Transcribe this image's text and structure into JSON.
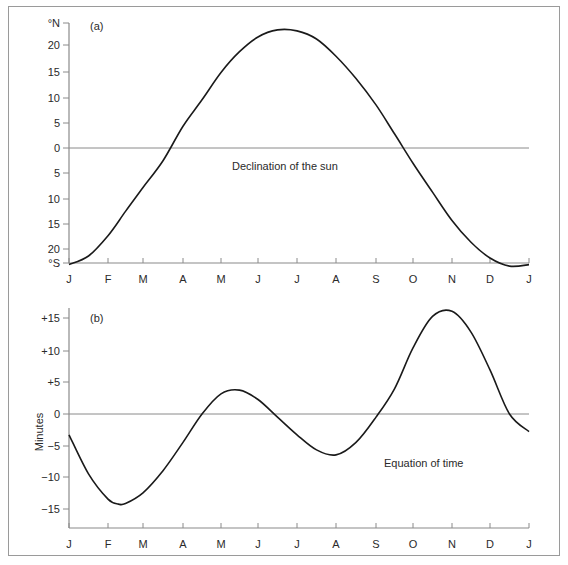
{
  "chart_data": [
    {
      "type": "line",
      "panel": "(a)",
      "title": "Declination of the sun",
      "xlabel": "",
      "ylabel": "",
      "x_tick_labels": [
        "J",
        "F",
        "M",
        "A",
        "M",
        "J",
        "J",
        "A",
        "S",
        "O",
        "N",
        "D",
        "J"
      ],
      "y_tick_labels": [
        "°N",
        "20",
        "15",
        "10",
        "5",
        "0",
        "5",
        "10",
        "15",
        "20",
        "°S"
      ],
      "y_units_top": "°N",
      "y_units_bottom": "°S",
      "ylim": [
        -23.5,
        23.5
      ],
      "grid": false,
      "zero_line": true,
      "series": [
        {
          "name": "Declination of the sun (degrees, N positive)",
          "x": [
            0,
            0.5,
            1,
            1.5,
            2,
            2.5,
            3,
            3.5,
            4,
            4.5,
            5,
            5.5,
            6,
            6.5,
            7,
            7.5,
            8,
            8.5,
            9,
            9.5,
            10,
            10.5,
            11,
            11.5,
            12
          ],
          "values": [
            -23.0,
            -21.3,
            -17.3,
            -12.5,
            -7.8,
            -2.5,
            4.3,
            9.5,
            14.9,
            19.0,
            21.9,
            23.3,
            23.1,
            21.5,
            18.1,
            13.7,
            8.5,
            2.8,
            -3.0,
            -8.7,
            -14.3,
            -18.6,
            -21.7,
            -23.3,
            -23.0
          ]
        }
      ]
    },
    {
      "type": "line",
      "panel": "(b)",
      "title": "Equation of time",
      "xlabel": "",
      "ylabel": "Minutes",
      "x_tick_labels": [
        "J",
        "F",
        "M",
        "A",
        "M",
        "J",
        "J",
        "A",
        "S",
        "O",
        "N",
        "D",
        "J"
      ],
      "y_tick_labels": [
        "+15",
        "+10",
        "+5",
        "0",
        "−5",
        "−10",
        "−15"
      ],
      "ylim": [
        -18,
        16.5
      ],
      "grid": false,
      "zero_line": true,
      "series": [
        {
          "name": "Equation of time (minutes)",
          "x": [
            0,
            0.5,
            1,
            1.3,
            1.5,
            2,
            2.5,
            3,
            3.5,
            4,
            4.5,
            5,
            5.5,
            6,
            6.5,
            7,
            7.5,
            8,
            8.5,
            9,
            9.5,
            10,
            10.5,
            11,
            11.5,
            12
          ],
          "values": [
            -3.3,
            -9.5,
            -13.5,
            -14.3,
            -14.2,
            -12.5,
            -9.0,
            -4.5,
            0,
            3.2,
            3.8,
            2.3,
            -0.5,
            -3.3,
            -5.7,
            -6.5,
            -4.5,
            -0.5,
            4.0,
            10.5,
            15.5,
            16.3,
            13.0,
            7.0,
            0,
            -2.8
          ]
        }
      ]
    }
  ],
  "panel_a": {
    "label": "(a)",
    "caption": "Declination of the sun",
    "y_ticks": [
      "°N",
      "20",
      "15",
      "10",
      "5",
      "0",
      "5",
      "10",
      "15",
      "20",
      "°S"
    ],
    "x_ticks": [
      "J",
      "F",
      "M",
      "A",
      "M",
      "J",
      "J",
      "A",
      "S",
      "O",
      "N",
      "D",
      "J"
    ]
  },
  "panel_b": {
    "label": "(b)",
    "caption": "Equation of time",
    "y_axis_title": "Minutes",
    "y_ticks": [
      "+15",
      "+10",
      "+5",
      "0",
      "−5",
      "−10",
      "−15"
    ],
    "x_ticks": [
      "J",
      "F",
      "M",
      "A",
      "M",
      "J",
      "J",
      "A",
      "S",
      "O",
      "N",
      "D",
      "J"
    ]
  },
  "colors": {
    "line": "#1a1a1a",
    "axis": "#8a8a8a",
    "frame": "#9a9a9a",
    "text": "#2a2a2a"
  }
}
